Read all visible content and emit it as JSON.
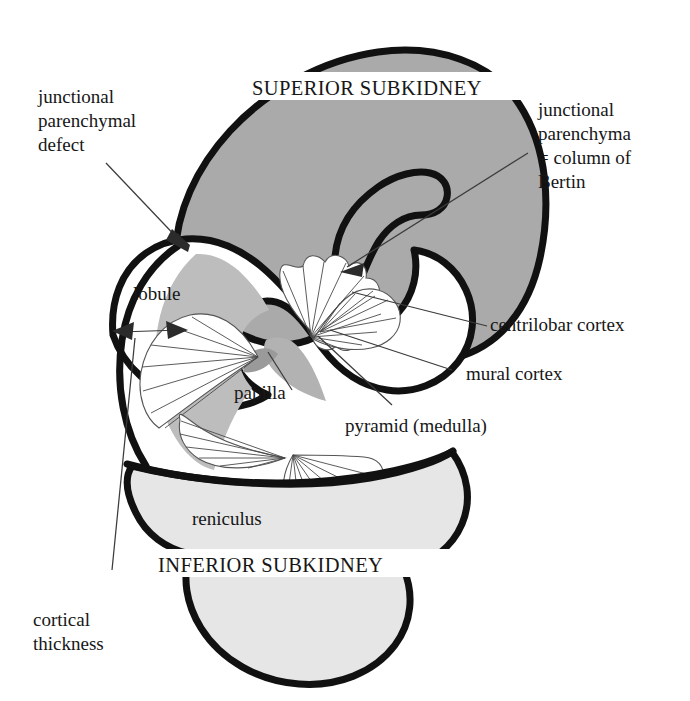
{
  "figure": {
    "title_hidden": "",
    "background_color": "#ffffff",
    "ink_color": "#111111",
    "superior_fill": "#aaaaaa",
    "inferior_fill": "#e6e6e6",
    "lobule_fill": "#bdbdbd",
    "papilla_fill": "#b5b5b5",
    "pyramid_fill": "#ffffff"
  },
  "labels": {
    "superior_subkidney": "SUPERIOR SUBKIDNEY",
    "inferior_subkidney": "INFERIOR SUBKIDNEY",
    "junctional_parenchymal_defect_line1": "junctional",
    "junctional_parenchymal_defect_line2": "parenchymal",
    "junctional_parenchymal_defect_line3": "defect",
    "junctional_parenchyma_line1": "junctional",
    "junctional_parenchyma_line2": "parenchyma",
    "junctional_parenchyma_line3": "= column of",
    "junctional_parenchyma_line4": "Bertin",
    "lobule": "lobule",
    "papilla": "papilla",
    "centrilobar_cortex": "centrilobar cortex",
    "mural_cortex": "mural cortex",
    "pyramid_medulla": "pyramid (medulla)",
    "reniculus": "reniculus",
    "cortical_thickness_line1": "cortical",
    "cortical_thickness_line2": "thickness"
  }
}
